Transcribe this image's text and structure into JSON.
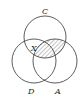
{
  "diagram": {
    "type": "venn-3",
    "circles": [
      {
        "label": "C",
        "cx": 45,
        "cy": 37,
        "r": 21
      },
      {
        "label": "D",
        "cx": 34,
        "cy": 61,
        "r": 22
      },
      {
        "label": "A",
        "cx": 55,
        "cy": 61,
        "r": 22
      }
    ],
    "region_label": "X",
    "region_label_location": "C ∩ D (outside A)",
    "shaded_region": "C ∩ A",
    "colors": {
      "stroke": "#333333",
      "background": "#ffffff"
    }
  },
  "labels": {
    "c": "C",
    "d": "D",
    "a": "A",
    "x": "X"
  }
}
